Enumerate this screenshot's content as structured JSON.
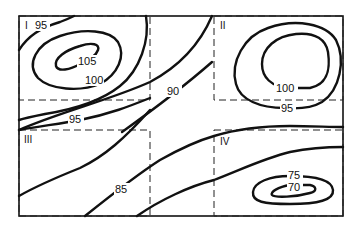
{
  "diagram": {
    "type": "contour-map",
    "quadrants": [
      {
        "id": "I",
        "label": "I"
      },
      {
        "id": "II",
        "label": "II"
      },
      {
        "id": "III",
        "label": "III"
      },
      {
        "id": "IV",
        "label": "IV"
      }
    ],
    "contour_labels": {
      "q1_outer": "95",
      "q1_mid": "100",
      "q1_inner": "105",
      "q2_inner": "100",
      "q2_outer": "95",
      "center": "90",
      "left_mid": "95",
      "lower": "85",
      "q4_outer": "75",
      "q4_inner": "70"
    },
    "colors": {
      "line": "#111111",
      "background": "#ffffff"
    }
  }
}
